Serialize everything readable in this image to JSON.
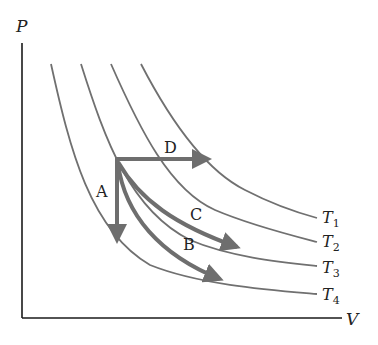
{
  "diagram": {
    "type": "PV-diagram",
    "axes": {
      "y_label": "P",
      "x_label": "V"
    },
    "isotherms": [
      {
        "id": "T1",
        "label": "T",
        "sub": "1"
      },
      {
        "id": "T2",
        "label": "T",
        "sub": "2"
      },
      {
        "id": "T3",
        "label": "T",
        "sub": "3"
      },
      {
        "id": "T4",
        "label": "T",
        "sub": "4"
      }
    ],
    "processes": [
      {
        "id": "A",
        "label": "A",
        "description": "isochoric (vertical, down)"
      },
      {
        "id": "B",
        "label": "B",
        "description": "curved path to T4"
      },
      {
        "id": "C",
        "label": "C",
        "description": "curved path to T3"
      },
      {
        "id": "D",
        "label": "D",
        "description": "isobaric (horizontal, right)"
      }
    ],
    "colors": {
      "axis": "#1a1a1a",
      "isotherm": "#707070",
      "process_arrow": "#6e6e6e",
      "text": "#222222"
    }
  }
}
